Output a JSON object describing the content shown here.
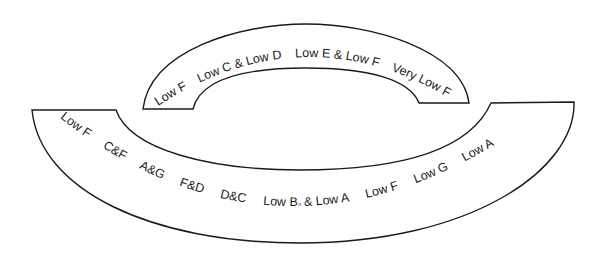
{
  "diagram": {
    "upper_arc": {
      "labels": [
        "Low F",
        "Low C & Low D",
        "Low E & Low F",
        "Very Low F"
      ]
    },
    "lower_arc": {
      "labels": [
        "Low F",
        "C&F",
        "A&G",
        "F&D",
        "D&C",
        "Low B",
        "♭",
        " & Low A",
        "Low F",
        "Low G",
        "Low A"
      ]
    },
    "colors": {
      "stroke": "#1a1a1a",
      "fill": "#ffffff"
    }
  }
}
